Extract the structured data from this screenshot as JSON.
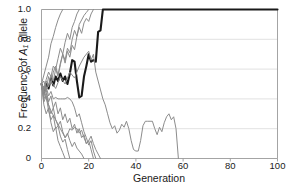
{
  "chart_data": {
    "type": "line",
    "title": "",
    "xlabel": "Generation",
    "ylabel": "Frequency of A1 allele",
    "ylabel_prefix": "Frequency of ",
    "ylabel_symbol": "A",
    "ylabel_subscript": "1",
    "ylabel_suffix": " allele",
    "xlim": [
      0,
      100
    ],
    "ylim": [
      0,
      1
    ],
    "xticks": [
      0,
      20,
      40,
      60,
      80,
      100
    ],
    "xtick_labels": [
      "0",
      "20",
      "40",
      "60",
      "80",
      "100"
    ],
    "yticks": [
      0,
      0.2,
      0.4,
      0.6,
      0.8,
      1.0
    ],
    "ytick_labels": [
      "0",
      "0.2",
      "0.4",
      "0.6",
      "0.8",
      "1.0"
    ],
    "grid": "horizontal",
    "grid_color": "#d9d9d9",
    "axis_color": "#9a9a9a",
    "legend": "none",
    "highlight_color": "#1a1a1a",
    "series_color": "#8c8c8c",
    "series": [
      {
        "name": "replicate-1-highlighted",
        "highlighted": true,
        "color": "#1a1a1a",
        "width": 2.1,
        "x": [
          0,
          1,
          2,
          3,
          4,
          5,
          6,
          7,
          8,
          9,
          10,
          11,
          12,
          13,
          14,
          15,
          16,
          17,
          18,
          19,
          20,
          21,
          22,
          23,
          24,
          25,
          26,
          27,
          40,
          60,
          80,
          100
        ],
        "values": [
          0.5,
          0.44,
          0.5,
          0.47,
          0.54,
          0.49,
          0.55,
          0.52,
          0.57,
          0.52,
          0.55,
          0.5,
          0.57,
          0.66,
          0.65,
          0.52,
          0.41,
          0.42,
          0.55,
          0.62,
          0.7,
          0.65,
          0.66,
          0.65,
          0.85,
          0.86,
          1.0,
          1.0,
          1.0,
          1.0,
          1.0,
          1.0
        ]
      },
      {
        "name": "replicate-2-fixed-early",
        "highlighted": false,
        "color": "#8c8c8c",
        "width": 1.0,
        "x": [
          0,
          1,
          2,
          3,
          4,
          5,
          6,
          7,
          8,
          9
        ],
        "values": [
          0.5,
          0.56,
          0.62,
          0.68,
          0.77,
          0.82,
          0.88,
          0.93,
          0.97,
          1.0
        ]
      },
      {
        "name": "replicate-3-fixed",
        "highlighted": false,
        "color": "#8c8c8c",
        "width": 1.0,
        "x": [
          0,
          1,
          2,
          3,
          4,
          5,
          6,
          7,
          8,
          9,
          10,
          11,
          12,
          13,
          14,
          15,
          16
        ],
        "values": [
          0.5,
          0.46,
          0.53,
          0.58,
          0.55,
          0.62,
          0.6,
          0.67,
          0.74,
          0.7,
          0.78,
          0.84,
          0.8,
          0.88,
          0.92,
          0.97,
          1.0
        ]
      },
      {
        "name": "replicate-4-fixed",
        "highlighted": false,
        "color": "#8c8c8c",
        "width": 1.0,
        "x": [
          0,
          1,
          2,
          3,
          4,
          5,
          6,
          7,
          8,
          9,
          10,
          11,
          12,
          13,
          14,
          15,
          16,
          17,
          18,
          19,
          20
        ],
        "values": [
          0.5,
          0.52,
          0.46,
          0.55,
          0.5,
          0.58,
          0.62,
          0.56,
          0.64,
          0.7,
          0.66,
          0.74,
          0.71,
          0.8,
          0.86,
          0.82,
          0.9,
          0.93,
          0.96,
          0.98,
          1.0
        ]
      },
      {
        "name": "replicate-5-fixed",
        "highlighted": false,
        "color": "#8c8c8c",
        "width": 1.0,
        "x": [
          0,
          1,
          2,
          3,
          4,
          5,
          6,
          7,
          8,
          9,
          10,
          11,
          12,
          13,
          14,
          15,
          16,
          17,
          18,
          19,
          20,
          21,
          22
        ],
        "values": [
          0.5,
          0.45,
          0.52,
          0.48,
          0.56,
          0.52,
          0.6,
          0.55,
          0.63,
          0.7,
          0.64,
          0.72,
          0.68,
          0.76,
          0.73,
          0.82,
          0.88,
          0.84,
          0.91,
          0.94,
          0.92,
          0.97,
          1.0
        ]
      },
      {
        "name": "replicate-6-long-lived-lost",
        "highlighted": false,
        "color": "#8c8c8c",
        "width": 1.0,
        "x": [
          0,
          2,
          4,
          6,
          8,
          10,
          12,
          14,
          16,
          18,
          20,
          21,
          22,
          23,
          24,
          25,
          26,
          27,
          28,
          29,
          30,
          31,
          32,
          33,
          34,
          35,
          36,
          37,
          38,
          39,
          40,
          41,
          42,
          43,
          44,
          45,
          46,
          47,
          48,
          49,
          50,
          51,
          52,
          53,
          54,
          55,
          56,
          57,
          58
        ],
        "values": [
          0.5,
          0.46,
          0.52,
          0.47,
          0.55,
          0.5,
          0.58,
          0.54,
          0.62,
          0.68,
          0.72,
          0.66,
          0.7,
          0.58,
          0.52,
          0.46,
          0.4,
          0.36,
          0.3,
          0.24,
          0.2,
          0.22,
          0.17,
          0.19,
          0.23,
          0.21,
          0.25,
          0.2,
          0.12,
          0.06,
          0.05,
          0.05,
          0.12,
          0.22,
          0.25,
          0.25,
          0.25,
          0.25,
          0.2,
          0.16,
          0.21,
          0.18,
          0.24,
          0.28,
          0.3,
          0.26,
          0.28,
          0.2,
          0.0
        ]
      },
      {
        "name": "replicate-7-lost",
        "highlighted": false,
        "color": "#8c8c8c",
        "width": 1.0,
        "x": [
          0,
          1,
          2,
          3,
          4,
          5,
          6,
          7,
          8,
          9,
          10,
          11,
          12,
          13,
          14,
          15,
          16,
          17,
          18,
          19,
          20,
          21,
          22,
          23
        ],
        "values": [
          0.5,
          0.44,
          0.48,
          0.42,
          0.45,
          0.4,
          0.41,
          0.4,
          0.4,
          0.4,
          0.4,
          0.41,
          0.4,
          0.38,
          0.34,
          0.28,
          0.3,
          0.24,
          0.18,
          0.14,
          0.09,
          0.12,
          0.05,
          0.0
        ]
      },
      {
        "name": "replicate-8-lost",
        "highlighted": false,
        "color": "#8c8c8c",
        "width": 1.0,
        "x": [
          0,
          1,
          2,
          3,
          4,
          5,
          6,
          7,
          8,
          9,
          10,
          11,
          12,
          13,
          14,
          15,
          16,
          17,
          18,
          19,
          20,
          21,
          22
        ],
        "values": [
          0.5,
          0.42,
          0.46,
          0.38,
          0.42,
          0.34,
          0.38,
          0.3,
          0.34,
          0.26,
          0.3,
          0.24,
          0.27,
          0.2,
          0.23,
          0.17,
          0.2,
          0.14,
          0.16,
          0.1,
          0.12,
          0.06,
          0.0
        ]
      },
      {
        "name": "replicate-9-lost",
        "highlighted": false,
        "color": "#8c8c8c",
        "width": 1.0,
        "x": [
          0,
          1,
          2,
          3,
          4,
          5,
          6,
          7,
          8,
          9,
          10,
          11,
          12,
          13,
          14,
          15,
          16,
          17,
          18
        ],
        "values": [
          0.5,
          0.4,
          0.44,
          0.36,
          0.3,
          0.34,
          0.26,
          0.22,
          0.25,
          0.18,
          0.14,
          0.17,
          0.12,
          0.08,
          0.11,
          0.07,
          0.05,
          0.03,
          0.0
        ]
      },
      {
        "name": "replicate-10-lost-fast",
        "highlighted": false,
        "color": "#8c8c8c",
        "width": 1.0,
        "x": [
          0,
          1,
          2,
          3,
          4,
          5,
          6,
          7,
          8,
          9,
          10,
          11,
          12
        ],
        "values": [
          0.5,
          0.38,
          0.42,
          0.32,
          0.26,
          0.29,
          0.2,
          0.22,
          0.15,
          0.11,
          0.13,
          0.06,
          0.0
        ]
      },
      {
        "name": "replicate-11-lost-fast",
        "highlighted": false,
        "color": "#8c8c8c",
        "width": 1.0,
        "x": [
          0,
          1,
          2,
          3,
          4,
          5,
          6,
          7,
          8,
          9,
          10
        ],
        "values": [
          0.5,
          0.36,
          0.3,
          0.34,
          0.24,
          0.18,
          0.21,
          0.12,
          0.08,
          0.04,
          0.0
        ]
      },
      {
        "name": "replicate-12-dip-recover-lost",
        "highlighted": false,
        "color": "#8c8c8c",
        "width": 1.0,
        "x": [
          0,
          2,
          4,
          6,
          8,
          10,
          11,
          12,
          13,
          14,
          15,
          16,
          17,
          18,
          19,
          20,
          21,
          22,
          23,
          24,
          25
        ],
        "values": [
          0.5,
          0.4,
          0.32,
          0.26,
          0.2,
          0.14,
          0.16,
          0.2,
          0.19,
          0.21,
          0.2,
          0.17,
          0.19,
          0.14,
          0.1,
          0.12,
          0.15,
          0.1,
          0.06,
          0.03,
          0.0
        ]
      }
    ]
  }
}
